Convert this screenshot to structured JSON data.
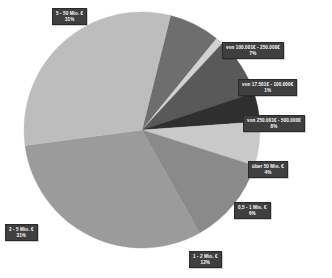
{
  "chart_data": {
    "type": "pie",
    "title": "",
    "subtitle": "",
    "xlabel": "",
    "ylabel": "",
    "legend_position": "none",
    "grid": false,
    "label_format": "category + percent",
    "units": "percent",
    "center": {
      "x": 142,
      "y": 130
    },
    "radius": 118,
    "start_angle_deg": -76,
    "direction": "clockwise",
    "categories": [
      "von 100.001€ - 250.000€",
      "von 17.501€ - 100.000€",
      "von 250.001€ - 500.000€",
      "über 50 Mio. €",
      "0,5 - 1 Mio. €",
      "1 - 2 Mio. €",
      "2 - 5 Mio. €",
      "5 - 50 Mio. €"
    ],
    "values": [
      7,
      1,
      8,
      4,
      6,
      12,
      31,
      31
    ],
    "percent_labels": [
      "7%",
      "1%",
      "8%",
      "4%",
      "6%",
      "12%",
      "31%",
      "31%"
    ],
    "colors": [
      "#6e6e6e",
      "#d2d2d2",
      "#595959",
      "#2f2f2f",
      "#c9c9c9",
      "#8a8a8a",
      "#9b9b9b",
      "#bdbdbd"
    ],
    "slices": [
      {
        "label": "von 100.001€ - 250.000€",
        "value": 7,
        "percent": "7%",
        "color": "#6e6e6e"
      },
      {
        "label": "von 17.501€ - 100.000€",
        "value": 1,
        "percent": "1%",
        "color": "#d2d2d2"
      },
      {
        "label": "von 250.001€ - 500.000€",
        "value": 8,
        "percent": "8%",
        "color": "#595959"
      },
      {
        "label": "über 50 Mio. €",
        "value": 4,
        "percent": "4%",
        "color": "#2f2f2f"
      },
      {
        "label": "0,5 - 1 Mio. €",
        "value": 6,
        "percent": "6%",
        "color": "#c9c9c9"
      },
      {
        "label": "1 - 2 Mio. €",
        "value": 12,
        "percent": "12%",
        "color": "#8a8a8a"
      },
      {
        "label": "2 - 5 Mio. €",
        "value": 31,
        "percent": "31%",
        "color": "#9b9b9b"
      },
      {
        "label": "5 - 50 Mio. €",
        "value": 31,
        "percent": "31%",
        "color": "#bdbdbd"
      }
    ]
  },
  "callouts": [
    {
      "name": "callout-5-50-mio",
      "category": "5 - 50 Mio. €",
      "percent": "31%",
      "left": 52,
      "top": 8
    },
    {
      "name": "callout-100001-250000",
      "category": "von 100.001€ - 250.000€",
      "percent": "7%",
      "left": 222,
      "top": 42
    },
    {
      "name": "callout-17501-100000",
      "category": "von 17.501€ - 100.000€",
      "percent": "1%",
      "left": 238,
      "top": 79
    },
    {
      "name": "callout-250001-500000",
      "category": "von 250.001€ - 500.000€",
      "percent": "8%",
      "left": 243,
      "top": 115
    },
    {
      "name": "callout-ueber-50-mio",
      "category": "über 50 Mio. €",
      "percent": "4%",
      "left": 248,
      "top": 161
    },
    {
      "name": "callout-05-1-mio",
      "category": "0,5 - 1 Mio. €",
      "percent": "6%",
      "left": 234,
      "top": 202
    },
    {
      "name": "callout-2-5-mio",
      "category": "2 - 5 Mio. €",
      "percent": "31%",
      "left": 5,
      "top": 224
    },
    {
      "name": "callout-1-2-mio",
      "category": "1 - 2 Mio. €",
      "percent": "12%",
      "left": 189,
      "top": 251
    }
  ],
  "style": {
    "background": "#ffffff",
    "callout_fill": "#3f3f3f",
    "callout_text": "#ffffff"
  }
}
